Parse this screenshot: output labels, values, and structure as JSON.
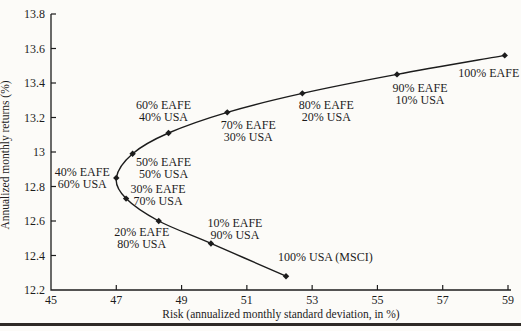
{
  "figure": {
    "background": "#fcfbf8",
    "ink": "#1c1c1c",
    "bottom_rule_color": "#2e2a26"
  },
  "chart_data": {
    "type": "line",
    "title": "",
    "xlabel": "Risk (annualized monthly standard deviation, in %)",
    "ylabel": "Annualized monthly returns (%)",
    "xlim": [
      45,
      59
    ],
    "ylim": [
      12.2,
      13.8
    ],
    "x_ticks": [
      45,
      47,
      49,
      51,
      53,
      55,
      57,
      59
    ],
    "y_ticks": [
      13.8,
      13.6,
      13.4,
      13.2,
      13,
      12.8,
      12.6,
      12.4,
      12.2
    ],
    "y_tick_labels": [
      "13.8",
      "13.6",
      "13.4",
      "13.2",
      "13",
      "12.8",
      "12.6",
      "12.4",
      "12.2"
    ],
    "grid": false,
    "legend_position": "none",
    "marker": "diamond",
    "series": [
      {
        "name": "EAFE/USA portfolios (efficient frontier)",
        "points": [
          {
            "x": 52.2,
            "y": 12.28,
            "label_lines": [
              "100% USA (MSCI)"
            ],
            "label_dx": -8,
            "label_dy": -19,
            "anchor": "start"
          },
          {
            "x": 49.9,
            "y": 12.47,
            "label_lines": [
              "10% EAFE",
              "90% USA"
            ],
            "label_dx": 24,
            "label_dy": -20,
            "anchor": "middle"
          },
          {
            "x": 48.3,
            "y": 12.6,
            "label_lines": [
              "20% EAFE",
              "80% USA"
            ],
            "label_dx": -17,
            "label_dy": 11,
            "anchor": "middle"
          },
          {
            "x": 47.3,
            "y": 12.73,
            "label_lines": [
              "30% EAFE",
              "70% USA"
            ],
            "label_dx": 32,
            "label_dy": -10,
            "anchor": "middle"
          },
          {
            "x": 47.0,
            "y": 12.85,
            "label_lines": [
              "40% EAFE",
              "60% USA"
            ],
            "label_dx": -34,
            "label_dy": -6,
            "anchor": "middle"
          },
          {
            "x": 47.5,
            "y": 12.99,
            "label_lines": [
              "50% EAFE",
              "50% USA"
            ],
            "label_dx": 31,
            "label_dy": 8,
            "anchor": "middle"
          },
          {
            "x": 48.6,
            "y": 13.11,
            "label_lines": [
              "60% EAFE",
              "40% USA"
            ],
            "label_dx": -5,
            "label_dy": -28,
            "anchor": "middle"
          },
          {
            "x": 50.4,
            "y": 13.23,
            "label_lines": [
              "70% EAFE",
              "30% USA"
            ],
            "label_dx": 21,
            "label_dy": 13,
            "anchor": "middle"
          },
          {
            "x": 52.7,
            "y": 13.34,
            "label_lines": [
              "80% EAFE",
              "20% USA"
            ],
            "label_dx": 24,
            "label_dy": 12,
            "anchor": "middle"
          },
          {
            "x": 55.6,
            "y": 13.45,
            "label_lines": [
              "90% EAFE",
              "10% USA"
            ],
            "label_dx": 23,
            "label_dy": 14,
            "anchor": "middle"
          },
          {
            "x": 58.9,
            "y": 13.56,
            "label_lines": [
              "100% EAFE"
            ],
            "label_dx": -16,
            "label_dy": 18,
            "anchor": "middle"
          }
        ]
      }
    ]
  }
}
